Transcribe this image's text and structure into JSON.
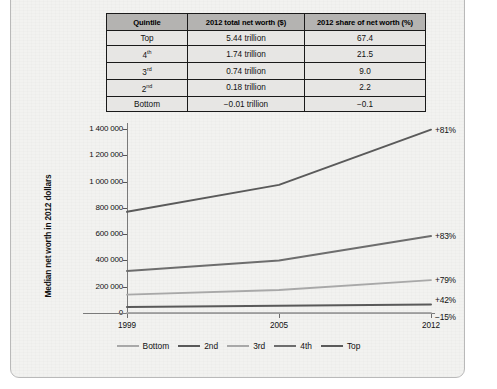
{
  "table": {
    "headers": [
      "Quintile",
      "2012 total net worth ($)",
      "2012 share of net worth (%)"
    ],
    "rows": [
      {
        "quintile": "Top",
        "sup": "",
        "networth": "5.44 trillion",
        "share": "67.4"
      },
      {
        "quintile": "4",
        "sup": "th",
        "networth": "1.74 trillion",
        "share": "21.5"
      },
      {
        "quintile": "3",
        "sup": "rd",
        "networth": "0.74 trillion",
        "share": "9.0"
      },
      {
        "quintile": "2",
        "sup": "nd",
        "networth": "0.18 trillion",
        "share": "2.2"
      },
      {
        "quintile": "Bottom",
        "sup": "",
        "networth": "−0.01 trillion",
        "share": "−0.1"
      }
    ]
  },
  "chart_data": {
    "type": "line",
    "title": "",
    "xlabel": "",
    "ylabel": "Median net worth in 2012 dollars",
    "x": [
      "1999",
      "2005",
      "2012"
    ],
    "ylim": [
      0,
      1400000
    ],
    "ytick_labels": [
      "1 400 000",
      "1 200 000",
      "1 000 000",
      "800 000",
      "600 000",
      "400 000",
      "200 000",
      "0"
    ],
    "ytick_values": [
      1400000,
      1200000,
      1000000,
      800000,
      600000,
      400000,
      200000,
      0
    ],
    "grid": false,
    "legend_position": "bottom",
    "series": [
      {
        "name": "Bottom",
        "values": [
          1000,
          900,
          850
        ],
        "annotation": "−15%",
        "color": "#a8a8a8"
      },
      {
        "name": "2nd",
        "values": [
          46000,
          55000,
          65000
        ],
        "annotation": "+42%",
        "color": "#595959"
      },
      {
        "name": "3rd",
        "values": [
          140000,
          175000,
          250000
        ],
        "annotation": "+79%",
        "color": "#a8a8a8"
      },
      {
        "name": "4th",
        "values": [
          320000,
          400000,
          585000
        ],
        "annotation": "+83%",
        "color": "#6d6d6d"
      },
      {
        "name": "Top",
        "values": [
          770000,
          975000,
          1395000
        ],
        "annotation": "+81%",
        "color": "#5a5a5a"
      }
    ]
  }
}
